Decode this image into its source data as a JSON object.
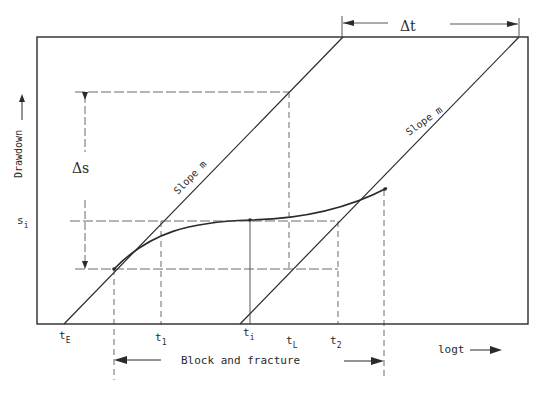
{
  "diagram": {
    "y_axis_label": "Drawdown",
    "x_axis_label": "logt",
    "delta_t_label": "Δt",
    "delta_s_label": "Δs",
    "s_i_label": {
      "main": "s",
      "sub": "i"
    },
    "slope_label_left": "Slope m",
    "slope_label_right": "Slope m",
    "region_label": "Block and fracture",
    "time_labels": [
      {
        "main": "t",
        "sub": "E"
      },
      {
        "main": "t",
        "sub": "1"
      },
      {
        "main": "t",
        "sub": "i"
      },
      {
        "main": "t",
        "sub": "L"
      },
      {
        "main": "t",
        "sub": "2"
      }
    ],
    "colors": {
      "line": "#2a2a2a",
      "background": "#ffffff"
    }
  }
}
